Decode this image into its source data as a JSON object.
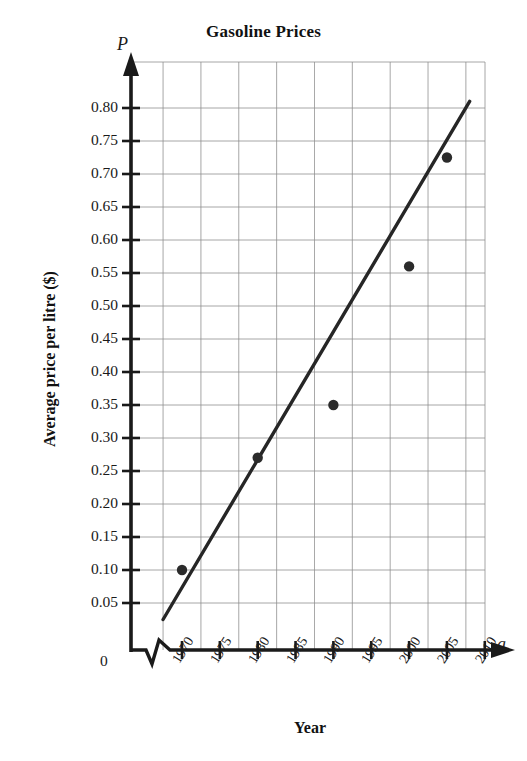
{
  "chart_data": {
    "type": "scatter",
    "title": "Gasoline Prices",
    "xlabel": "Year",
    "ylabel": "Average price per litre ($)",
    "x_axis_variable": "a",
    "y_axis_variable": "P",
    "grid": true,
    "legend": "none",
    "x": [
      1970,
      1980,
      1990,
      2000,
      2005
    ],
    "values": [
      0.1,
      0.27,
      0.35,
      0.56,
      0.725
    ],
    "series": [
      {
        "name": "Average price per litre",
        "points": [
          {
            "x": 1970,
            "y": 0.1
          },
          {
            "x": 1980,
            "y": 0.27
          },
          {
            "x": 1990,
            "y": 0.35
          },
          {
            "x": 2000,
            "y": 0.56
          },
          {
            "x": 2005,
            "y": 0.725
          }
        ]
      }
    ],
    "trend_line": {
      "name": "line of best fit",
      "x_start": 1967.5,
      "y_start": 0.025,
      "x_end": 2008.0,
      "y_end": 0.81
    },
    "xlim": [
      1967.0,
      2011.0
    ],
    "ylim": [
      0.0,
      0.835
    ],
    "x_tick_labels": [
      "1970",
      "1975",
      "1980",
      "1985",
      "1990",
      "1995",
      "2000",
      "2005",
      "2010"
    ],
    "x_ticks": [
      1970,
      1975,
      1980,
      1985,
      1990,
      1995,
      2000,
      2005,
      2010
    ],
    "y_tick_labels": [
      "0.80",
      "0.75",
      "0.70",
      "0.65",
      "0.60",
      "0.55",
      "0.50",
      "0.45",
      "0.40",
      "0.35",
      "0.30",
      "0.25",
      "0.20",
      "0.15",
      "0.10",
      "0.05"
    ],
    "y_ticks": [
      0.8,
      0.75,
      0.7,
      0.65,
      0.6,
      0.55,
      0.5,
      0.45,
      0.4,
      0.35,
      0.3,
      0.25,
      0.2,
      0.15,
      0.1,
      0.05
    ],
    "origin_label": "0",
    "axis_break": "x-axis zigzag break between origin and 1970",
    "colors": {
      "axis": "#1a1a1a",
      "grid": "#8c8c8c",
      "marker": "#2b2b2b",
      "trend_line": "#262626",
      "background": "#ffffff"
    }
  }
}
